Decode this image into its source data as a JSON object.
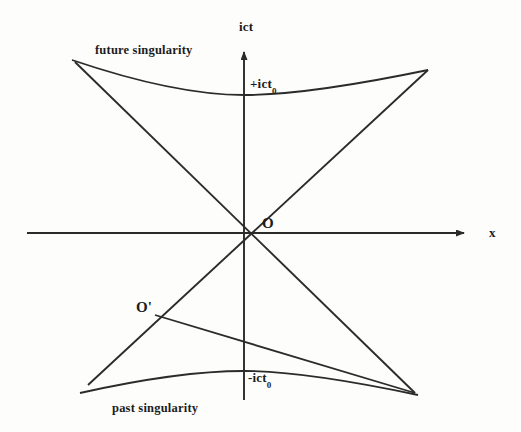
{
  "figure": {
    "background_color": "#fdfdfc",
    "line_color": "#2b2b2b"
  },
  "axes": {
    "vertical_label": "ict",
    "horizontal_label": "x",
    "origin_label": "O",
    "origin_x": 244,
    "origin_y": 233
  },
  "labels": {
    "future_singularity": "future singularity",
    "past_singularity": "past singularity",
    "positive_tick": "+ict",
    "positive_tick_sub": "0",
    "negative_tick": "-ict",
    "negative_tick_sub": "0",
    "shifted_origin": "O'"
  },
  "chart_data": {
    "type": "line",
    "xlabel": "x",
    "ylabel": "ict",
    "grid": false,
    "legend": "none",
    "xlim": [
      -244,
      277
    ],
    "ylim": [
      -199,
      185
    ],
    "annotations": [
      {
        "text": "future singularity",
        "x": 100,
        "y": 55
      },
      {
        "text": "past singularity",
        "x": 115,
        "y": 410
      },
      {
        "text": "+ict0",
        "x": 252,
        "y": 88
      },
      {
        "text": "-ict0",
        "x": 250,
        "y": 382
      },
      {
        "text": "O",
        "x": 264,
        "y": 226
      },
      {
        "text": "O'",
        "x": 140,
        "y": 310
      }
    ],
    "series": [
      {
        "name": "vertical-axis",
        "kind": "axis",
        "points": [
          [
            244,
            400
          ],
          [
            244,
            48
          ]
        ],
        "arrow_end": true
      },
      {
        "name": "horizontal-axis",
        "kind": "axis",
        "points": [
          [
            27,
            233
          ],
          [
            470,
            233
          ]
        ],
        "arrow_end": true
      },
      {
        "name": "lightcone-upper-left-to-lower-right",
        "kind": "line",
        "points": [
          [
            75,
            62
          ],
          [
            415,
            393
          ]
        ]
      },
      {
        "name": "lightcone-lower-left-to-upper-right",
        "kind": "line",
        "points": [
          [
            88,
            385
          ],
          [
            428,
            70
          ]
        ]
      },
      {
        "name": "future-singularity-hyperbola",
        "kind": "hyperbola",
        "vertex": [
          244,
          95
        ],
        "left_end": [
          72,
          60
        ],
        "right_end": [
          428,
          70
        ],
        "branch": "upper"
      },
      {
        "name": "past-singularity-hyperbola",
        "kind": "hyperbola",
        "vertex": [
          244,
          371
        ],
        "left_end": [
          80,
          393
        ],
        "right_end": [
          418,
          395
        ],
        "branch": "lower"
      },
      {
        "name": "shifted-observer-worldline",
        "kind": "line",
        "points": [
          [
            155,
            315
          ],
          [
            415,
            393
          ]
        ]
      }
    ]
  }
}
